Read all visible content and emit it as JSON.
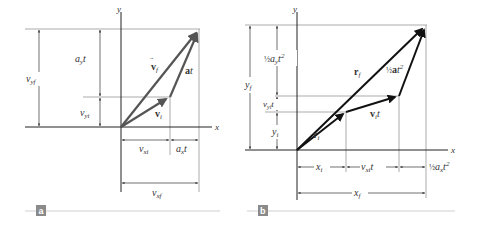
{
  "figure": {
    "panel_a": {
      "tag": "a",
      "axes": {
        "x": "x",
        "y": "y"
      },
      "vectors": {
        "vf": {
          "symbol": "v",
          "sub": "f"
        },
        "vi": {
          "symbol": "v",
          "sub": "i"
        },
        "at": {
          "symbol": "a",
          "suffix": "t"
        }
      },
      "dimensions": {
        "vyf": {
          "main": "v",
          "sub": "yf"
        },
        "ayt": {
          "main": "a",
          "sub": "y",
          "suffix": "t"
        },
        "vyi": {
          "main": "v",
          "sub": "yi"
        },
        "vxi": {
          "main": "v",
          "sub": "xi"
        },
        "axt": {
          "main": "a",
          "sub": "x",
          "suffix": "t"
        },
        "vxf": {
          "main": "v",
          "sub": "xf"
        }
      }
    },
    "panel_b": {
      "tag": "b",
      "axes": {
        "x": "x",
        "y": "y"
      },
      "vectors": {
        "rf": {
          "symbol": "r",
          "sub": "f"
        },
        "ri": {
          "symbol": "r",
          "sub": "i"
        },
        "vit": {
          "symbol": "v",
          "sub": "i",
          "suffix": "t"
        },
        "half_at2": {
          "frac": "½",
          "symbol": "a",
          "suffix": "t",
          "sup": "2"
        }
      },
      "dimensions": {
        "yf": {
          "main": "y",
          "sub": "f"
        },
        "half_ayt2": {
          "frac": "½",
          "main": "a",
          "sub": "y",
          "suffix": "t",
          "sup": "2"
        },
        "vyit": {
          "main": "v",
          "sub": "yi",
          "suffix": "t"
        },
        "yi": {
          "main": "y",
          "sub": "i"
        },
        "xi": {
          "main": "x",
          "sub": "i"
        },
        "vxit": {
          "main": "v",
          "sub": "xi",
          "suffix": "t"
        },
        "half_axt2": {
          "frac": "½",
          "main": "a",
          "sub": "x",
          "suffix": "t",
          "sup": "2"
        },
        "xf": {
          "main": "x",
          "sub": "f"
        }
      }
    },
    "colors": {
      "vector_a": "#555555",
      "vector_b": "#111111",
      "guide": "#888888",
      "axis": "#222222",
      "tag_bg": "#8a8a8a",
      "rule": "#d0d0d0"
    }
  }
}
